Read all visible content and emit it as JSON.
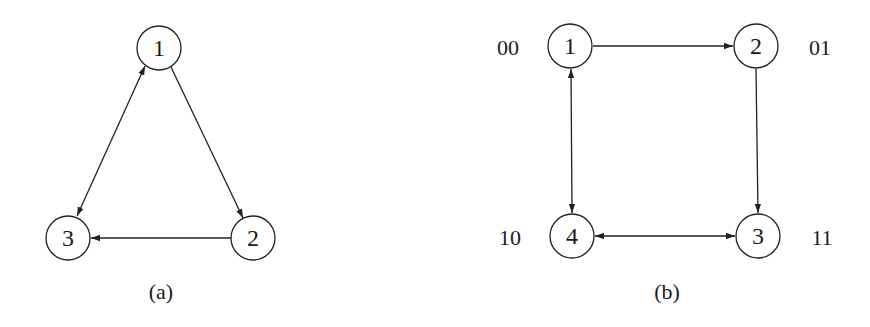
{
  "diagrams": {
    "a": {
      "caption": "(a)",
      "nodes": [
        {
          "id": "1",
          "label": "1",
          "x": 159,
          "y": 48
        },
        {
          "id": "2",
          "label": "2",
          "x": 253,
          "y": 238
        },
        {
          "id": "3",
          "label": "3",
          "x": 68,
          "y": 238
        }
      ],
      "edges": [
        {
          "from": "1",
          "to": "2",
          "type": "directed"
        },
        {
          "from": "2",
          "to": "3",
          "type": "directed"
        },
        {
          "from": "1",
          "to": "3",
          "type": "bidirectional"
        }
      ]
    },
    "b": {
      "caption": "(b)",
      "nodes": [
        {
          "id": "1",
          "label": "1",
          "code": "00",
          "x": 570,
          "y": 46
        },
        {
          "id": "2",
          "label": "2",
          "code": "01",
          "x": 756,
          "y": 46
        },
        {
          "id": "3",
          "label": "3",
          "code": "11",
          "x": 758,
          "y": 236
        },
        {
          "id": "4",
          "label": "4",
          "code": "10",
          "x": 572,
          "y": 236
        }
      ],
      "edges": [
        {
          "from": "1",
          "to": "2",
          "type": "directed"
        },
        {
          "from": "2",
          "to": "3",
          "type": "directed"
        },
        {
          "from": "1",
          "to": "4",
          "type": "bidirectional"
        },
        {
          "from": "4",
          "to": "3",
          "type": "bidirectional"
        }
      ]
    }
  },
  "style": {
    "stroke": "#222222",
    "text": "#1a1a1a",
    "background": "#ffffff"
  }
}
